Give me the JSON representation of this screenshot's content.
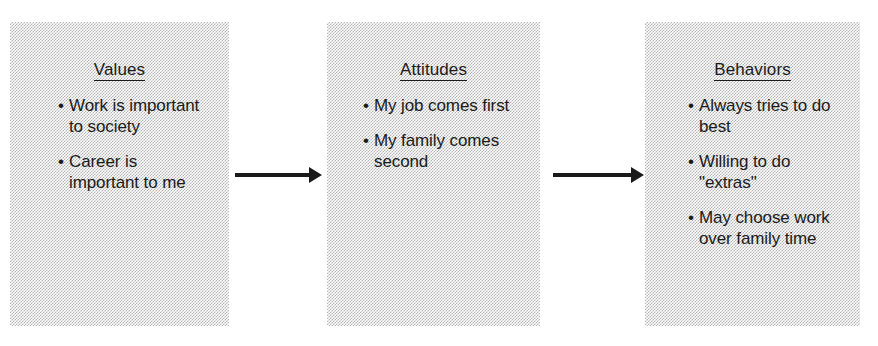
{
  "diagram": {
    "box_fill_color": "#d0d0d0",
    "text_color": "#1a1a1a",
    "arrow_color": "#1a1a1a",
    "background_color": "#ffffff",
    "boxes": [
      {
        "id": "values",
        "heading": "Values",
        "bullet_glyph": "•",
        "bullets": [
          "Work is important to society",
          "Career is important to me"
        ]
      },
      {
        "id": "attitudes",
        "heading": "Attitudes",
        "bullet_glyph": "•",
        "bullets": [
          "My job comes first",
          "My family comes second"
        ]
      },
      {
        "id": "behaviors",
        "heading": "Behaviors",
        "bullet_glyph": "•",
        "bullets": [
          "Always tries to do best",
          "Willing to do \"extras\"",
          "May choose work over family time"
        ]
      }
    ],
    "arrows": [
      {
        "id": "values-to-attitudes",
        "from": "values",
        "to": "attitudes"
      },
      {
        "id": "attitudes-to-behaviors",
        "from": "attitudes",
        "to": "behaviors"
      }
    ]
  }
}
